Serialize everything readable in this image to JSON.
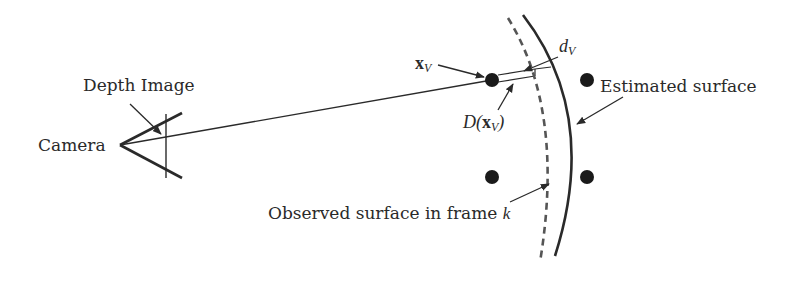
{
  "diagram": {
    "labels": {
      "camera": "Camera",
      "depth_image": "Depth Image",
      "estimated_surface": "Estimated surface",
      "observed_surface_prefix": "Observed surface in frame ",
      "observed_surface_frame_var": "k",
      "point_label_base": "x",
      "point_label_sub": "V",
      "distance_label_base": "d",
      "distance_label_sub": "V",
      "depth_label_prefix": "D(",
      "depth_label_x": "x",
      "depth_label_sub": "V",
      "depth_label_suffix": ")"
    },
    "colors": {
      "stroke": "#2a2a2a",
      "dashed_curve": "#555555",
      "background": "#ffffff"
    },
    "elements": {
      "camera_apex": [
        120,
        145
      ],
      "voxel_points": [
        [
          492,
          80
        ],
        [
          587,
          80
        ],
        [
          492,
          177
        ],
        [
          587,
          177
        ]
      ],
      "estimated_surface": "solid curve",
      "observed_surface": "dashed curve"
    }
  }
}
